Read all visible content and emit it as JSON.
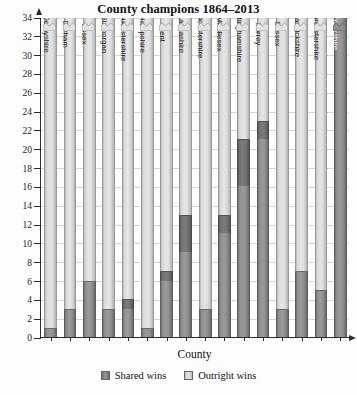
{
  "chart_data": {
    "type": "bar",
    "stacked": true,
    "title": "County champions 1864–2013",
    "xlabel": "County",
    "ylabel": "Number of wins",
    "ylim": [
      0,
      34
    ],
    "ytick_step": 2,
    "yticks": [
      0,
      2,
      4,
      6,
      8,
      10,
      12,
      14,
      16,
      18,
      20,
      22,
      24,
      26,
      28,
      30,
      32,
      34
    ],
    "grid": true,
    "legend_position": "bottom",
    "note": "All bars are drawn with a zigzag break at the top of the axis; the Outright wins component runs off-scale for every county and Yorkshire's Shared wins bar also exceeds the axis maximum.",
    "categories": [
      "Derbyshire",
      "Durham",
      "Essex",
      "Glamorgan",
      "Gloucestershire",
      "Hampshire",
      "Kent",
      "Lancashire",
      "Leicestershire",
      "Middlesex",
      "Nottinghamshire",
      "Surrey",
      "Sussex",
      "Warwickshire",
      "Worcestershire",
      "Yorkshire"
    ],
    "series": [
      {
        "name": "Shared wins",
        "color": "#8b8b8b",
        "values": [
          1,
          3,
          6,
          3,
          4,
          1,
          7,
          13,
          3,
          13,
          21,
          23,
          3,
          7,
          5,
          34
        ]
      },
      {
        "name": "Outright wins",
        "color": "#e0e0e0",
        "values": [
          33,
          31,
          28,
          31,
          30,
          33,
          27,
          21,
          31,
          21,
          13,
          11,
          31,
          27,
          29,
          0
        ]
      }
    ],
    "segment_detail": [
      {
        "county": "Derbyshire",
        "shared": 1,
        "shared_lower": 0,
        "broken_top": true
      },
      {
        "county": "Durham",
        "shared": 3,
        "shared_lower": 0,
        "broken_top": true
      },
      {
        "county": "Essex",
        "shared": 6,
        "shared_lower": 0,
        "broken_top": true
      },
      {
        "county": "Glamorgan",
        "shared": 3,
        "shared_lower": 0,
        "broken_top": true
      },
      {
        "county": "Gloucestershire",
        "shared": 4,
        "shared_lower": 3,
        "broken_top": true
      },
      {
        "county": "Hampshire",
        "shared": 1,
        "shared_lower": 0,
        "broken_top": true
      },
      {
        "county": "Kent",
        "shared": 7,
        "shared_lower": 6,
        "broken_top": true
      },
      {
        "county": "Lancashire",
        "shared": 13,
        "shared_lower": 9,
        "broken_top": true
      },
      {
        "county": "Leicestershire",
        "shared": 3,
        "shared_lower": 0,
        "broken_top": true
      },
      {
        "county": "Middlesex",
        "shared": 13,
        "shared_lower": 11,
        "broken_top": true
      },
      {
        "county": "Nottinghamshire",
        "shared": 21,
        "shared_lower": 16,
        "broken_top": true
      },
      {
        "county": "Surrey",
        "shared": 23,
        "shared_lower": 21,
        "broken_top": true
      },
      {
        "county": "Sussex",
        "shared": 3,
        "shared_lower": 0,
        "broken_top": true
      },
      {
        "county": "Warwickshire",
        "shared": 7,
        "shared_lower": 0,
        "broken_top": true
      },
      {
        "county": "Worcestershire",
        "shared": 5,
        "shared_lower": 0,
        "broken_top": true
      },
      {
        "county": "Yorkshire",
        "shared": 34,
        "shared_lower": 0,
        "broken_top": true,
        "all_shared": true
      }
    ]
  },
  "legend": {
    "items": [
      {
        "label": "Shared wins",
        "key": "shared"
      },
      {
        "label": "Outright wins",
        "key": "outright"
      }
    ]
  },
  "colors": {
    "shared": "#8b8b8b",
    "outright": "#e0e0e0",
    "axis": "#2b2b2b",
    "grid": "#d6d6d6",
    "background": "#fdfdfd"
  }
}
